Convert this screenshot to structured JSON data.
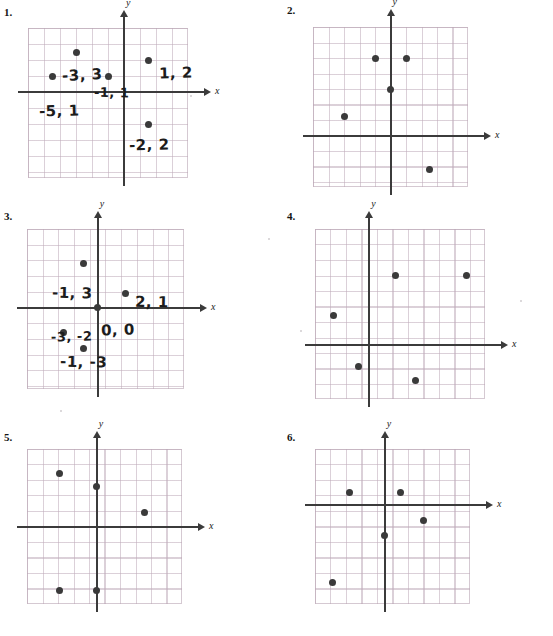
{
  "page": {
    "background_color": "#ffffff",
    "grid_color": "#beaab9",
    "axis_color": "#3b3b3b",
    "point_color": "#3a3a3a",
    "handwriting_color": "#1c1c1c"
  },
  "axis_labels": {
    "x": "x",
    "y": "y"
  },
  "problems": [
    {
      "number": "1.",
      "has_handwriting": true,
      "grid": {
        "cols": 10,
        "rows": 9,
        "origin_col": 6,
        "origin_row": 4
      },
      "points": [
        {
          "col": 3,
          "row": 1.5
        },
        {
          "col": 1.5,
          "row": 3
        },
        {
          "col": 5,
          "row": 3
        },
        {
          "col": 7.5,
          "row": 2
        },
        {
          "col": 7.5,
          "row": 6
        }
      ],
      "labels": [
        {
          "text": "-3, 3",
          "col": 2.1,
          "row": 2.35,
          "style": "big skew-a"
        },
        {
          "text": "1, 2",
          "col": 8.2,
          "row": 2.25,
          "style": "big"
        },
        {
          "text": "-1, 1",
          "col": 4.1,
          "row": 3.55,
          "style": "skew-b"
        },
        {
          "text": "-5, 1",
          "col": 0.7,
          "row": 4.65,
          "style": "big"
        },
        {
          "text": "-2, 2",
          "col": 6.3,
          "row": 6.75,
          "style": "big"
        }
      ]
    },
    {
      "number": "2.",
      "has_handwriting": false,
      "grid": {
        "cols": 10,
        "rows": 10,
        "origin_col": 5,
        "origin_row": 7
      },
      "points": [
        {
          "col": 4,
          "row": 2
        },
        {
          "col": 6,
          "row": 2
        },
        {
          "col": 5,
          "row": 4
        },
        {
          "col": 2,
          "row": 5.8
        },
        {
          "col": 7.5,
          "row": 9.2
        }
      ],
      "labels": []
    },
    {
      "number": "3.",
      "has_handwriting": true,
      "grid": {
        "cols": 10,
        "rows": 10,
        "origin_col": 4.5,
        "origin_row": 5
      },
      "points": [
        {
          "col": 3.6,
          "row": 2.2
        },
        {
          "col": 6.3,
          "row": 4.1
        },
        {
          "col": 4.5,
          "row": 5
        },
        {
          "col": 2.3,
          "row": 6.6
        },
        {
          "col": 3.6,
          "row": 7.6
        }
      ],
      "labels": [
        {
          "text": "-1, 3",
          "col": 1.6,
          "row": 3.5,
          "style": "big skew-b"
        },
        {
          "text": "2, 1",
          "col": 6.9,
          "row": 4.1,
          "style": "big skew-b"
        },
        {
          "text": "0, 0",
          "col": 4.7,
          "row": 5.85,
          "style": "big"
        },
        {
          "text": "-3, -2",
          "col": 1.5,
          "row": 6.35,
          "style": ""
        },
        {
          "text": "-1, -3",
          "col": 2.1,
          "row": 7.9,
          "style": "big skew-b"
        }
      ]
    },
    {
      "number": "4.",
      "has_handwriting": false,
      "grid": {
        "cols": 11,
        "rows": 11,
        "origin_col": 3.5,
        "origin_row": 7.5
      },
      "points": [
        {
          "col": 5.2,
          "row": 3
        },
        {
          "col": 9.8,
          "row": 3
        },
        {
          "col": 1.2,
          "row": 5.6
        },
        {
          "col": 2.8,
          "row": 8.9
        },
        {
          "col": 6.5,
          "row": 9.8
        }
      ],
      "labels": []
    },
    {
      "number": "5.",
      "has_handwriting": false,
      "grid": {
        "cols": 10,
        "rows": 10,
        "origin_col": 4.5,
        "origin_row": 5
      },
      "points": [
        {
          "col": 2.1,
          "row": 1.6
        },
        {
          "col": 4.5,
          "row": 2.4
        },
        {
          "col": 7.6,
          "row": 4.1
        },
        {
          "col": 2.1,
          "row": 9.1
        },
        {
          "col": 4.5,
          "row": 9.1
        }
      ],
      "labels": []
    },
    {
      "number": "6.",
      "has_handwriting": false,
      "grid": {
        "cols": 10,
        "rows": 10,
        "origin_col": 4.5,
        "origin_row": 3.6
      },
      "points": [
        {
          "col": 2.2,
          "row": 2.8
        },
        {
          "col": 5.5,
          "row": 2.8
        },
        {
          "col": 7.0,
          "row": 4.6
        },
        {
          "col": 4.5,
          "row": 5.6
        },
        {
          "col": 1.1,
          "row": 8.6
        }
      ],
      "labels": []
    }
  ],
  "specks": [
    {
      "x": 268,
      "y": 238,
      "d": 2
    },
    {
      "x": 300,
      "y": 330,
      "d": 2
    },
    {
      "x": 190,
      "y": 95,
      "d": 2
    },
    {
      "x": 520,
      "y": 300,
      "d": 2
    },
    {
      "x": 60,
      "y": 410,
      "d": 2
    }
  ]
}
